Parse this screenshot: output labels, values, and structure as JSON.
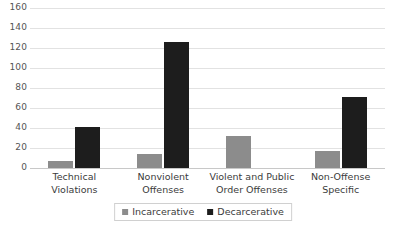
{
  "chart_data": {
    "type": "bar",
    "title": "",
    "subtitle": "",
    "xlabel": "",
    "ylabel": "",
    "ylim": [
      0,
      160
    ],
    "ytick_step": 20,
    "yticks": [
      "0",
      "20",
      "40",
      "60",
      "80",
      "100",
      "120",
      "140",
      "160"
    ],
    "grid": true,
    "grid_axis": "y",
    "legend_position": "bottom",
    "categories": [
      "Technical Violations",
      "Nonviolent Offenses",
      "Violent and Public Order Offenses",
      "Non-Offense Specific"
    ],
    "category_lines": [
      [
        "Technical",
        "Violations"
      ],
      [
        "Nonviolent",
        "Offenses"
      ],
      [
        "Violent and Public",
        "Order Offenses"
      ],
      [
        "Non-Offense",
        "Specific"
      ]
    ],
    "series": [
      {
        "name": "Incarcerative",
        "color": "#8c8c8c",
        "values": [
          7,
          14,
          32,
          17
        ]
      },
      {
        "name": "Decarcerative",
        "color": "#1d1d1d",
        "values": [
          41,
          126,
          0,
          71
        ]
      }
    ]
  },
  "legend": {
    "entries": [
      {
        "label": "Incarcerative",
        "swatch": "incarcerative-swatch-icon"
      },
      {
        "label": "Decarcerative",
        "swatch": "decarcerative-swatch-icon"
      }
    ]
  },
  "colors": {
    "incarcerative": "#8c8c8c",
    "decarcerative": "#1d1d1d",
    "gridline": "#e2e2e2",
    "axis": "#c8c8c8",
    "text": "#3b3b3b",
    "background": "#ffffff"
  }
}
